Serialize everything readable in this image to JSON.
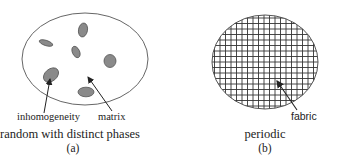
{
  "panels": [
    {
      "id": "a",
      "caption": "random with distinct phases",
      "sublabel": "(a)",
      "labels": {
        "inclusion": "inhomogeneity",
        "host": "matrix"
      }
    },
    {
      "id": "b",
      "caption": "periodic",
      "sublabel": "(b)",
      "labels": {
        "structure": "fabric"
      }
    }
  ],
  "colors": {
    "outline": "#555555",
    "inclusion_fill": "#8a8a8a",
    "grid_line": "#333333",
    "arrow": "#222222"
  }
}
